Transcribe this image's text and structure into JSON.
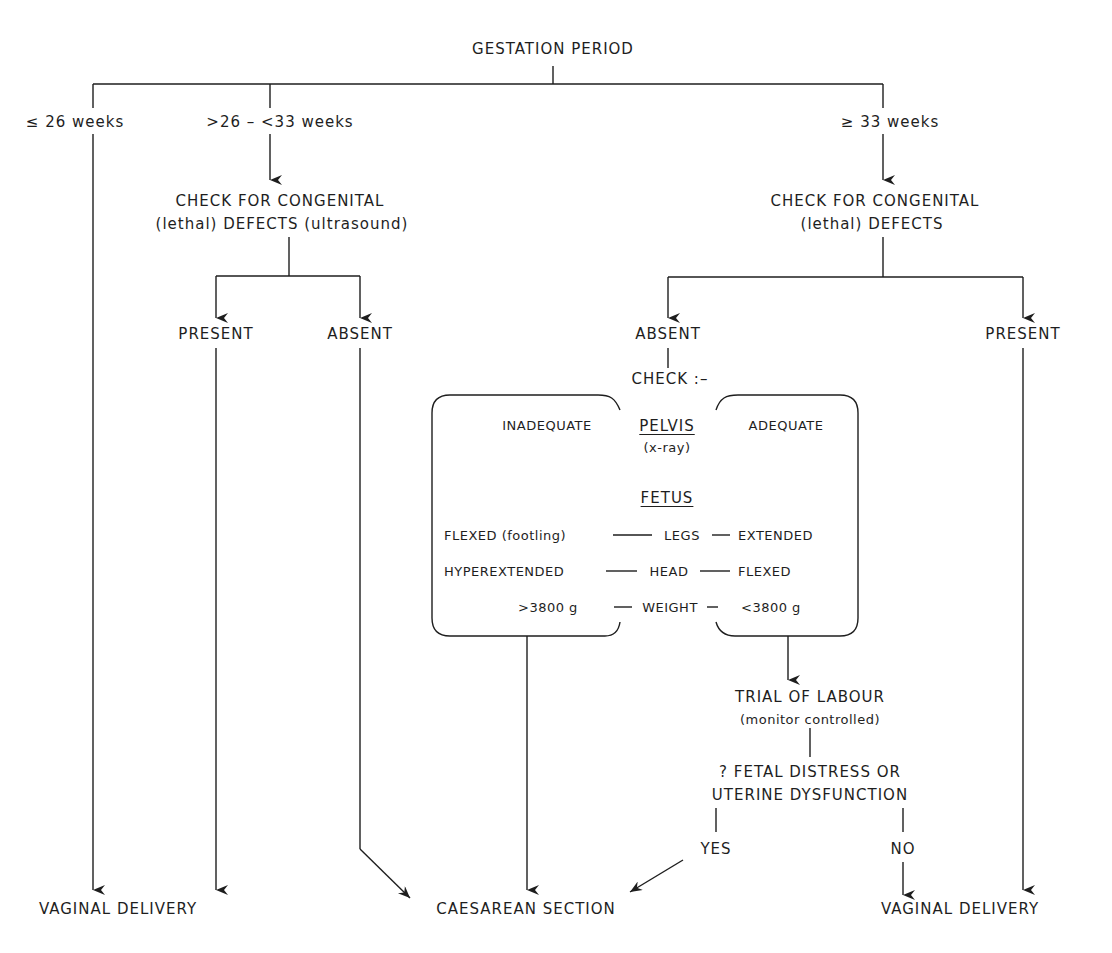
{
  "root": {
    "label": "GESTATION PERIOD"
  },
  "branches": {
    "b1": {
      "label": "≤ 26 weeks"
    },
    "b2": {
      "label": ">26 – <33 weeks"
    },
    "b3": {
      "label": "≥ 33 weeks"
    }
  },
  "check_mid": {
    "line1": "CHECK FOR CONGENITAL",
    "line2": "(lethal) DEFECTS (ultrasound)"
  },
  "check_right": {
    "line1": "CHECK FOR CONGENITAL",
    "line2": "(lethal) DEFECTS"
  },
  "mid_outcomes": {
    "present": "PRESENT",
    "absent": "ABSENT"
  },
  "right_outcomes": {
    "absent": "ABSENT",
    "present": "PRESENT"
  },
  "check_label": "CHECK :–",
  "box": {
    "inadequate": "INADEQUATE",
    "adequate": "ADEQUATE",
    "pelvis": "PELVIS",
    "pelvis_note": "(x-ray)",
    "fetus": "FETUS",
    "rows": [
      {
        "left": "FLEXED (footling)",
        "center": "LEGS",
        "right": "EXTENDED"
      },
      {
        "left": "HYPEREXTENDED",
        "center": "HEAD",
        "right": "FLEXED"
      },
      {
        "left": ">3800 g",
        "center": "WEIGHT",
        "right": "<3800 g"
      }
    ]
  },
  "trial": {
    "line1": "TRIAL OF LABOUR",
    "line2": "(monitor controlled)"
  },
  "distress": {
    "line1": "? FETAL DISTRESS OR",
    "line2": "UTERINE DYSFUNCTION"
  },
  "answers": {
    "yes": "YES",
    "no": "NO"
  },
  "endpoints": {
    "vaginal_left": "VAGINAL DELIVERY",
    "caesarean": "CAESAREAN SECTION",
    "vaginal_right": "VAGINAL DELIVERY"
  }
}
